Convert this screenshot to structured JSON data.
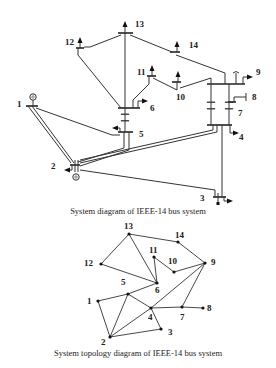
{
  "system_diagram": {
    "caption": "System diagram of IEEE-14 bus system",
    "bus_labels": {
      "1": "1",
      "2": "2",
      "3": "3",
      "4": "4",
      "5": "5",
      "6": "6",
      "7": "7",
      "8": "8",
      "9": "9",
      "10": "10",
      "11": "11",
      "12": "12",
      "13": "13",
      "14": "14"
    }
  },
  "topology_diagram": {
    "caption": "System topology diagram of IEEE-14 bus system",
    "nodes": [
      {
        "id": "1",
        "label": "1"
      },
      {
        "id": "2",
        "label": "2"
      },
      {
        "id": "3",
        "label": "3"
      },
      {
        "id": "4",
        "label": "4"
      },
      {
        "id": "5",
        "label": "5"
      },
      {
        "id": "6",
        "label": "6"
      },
      {
        "id": "7",
        "label": "7"
      },
      {
        "id": "8",
        "label": "8"
      },
      {
        "id": "9",
        "label": "9"
      },
      {
        "id": "10",
        "label": "10"
      },
      {
        "id": "11",
        "label": "11"
      },
      {
        "id": "12",
        "label": "12"
      },
      {
        "id": "13",
        "label": "13"
      },
      {
        "id": "14",
        "label": "14"
      }
    ],
    "edges": [
      [
        "1",
        "2"
      ],
      [
        "1",
        "5"
      ],
      [
        "2",
        "3"
      ],
      [
        "2",
        "4"
      ],
      [
        "2",
        "5"
      ],
      [
        "3",
        "4"
      ],
      [
        "4",
        "5"
      ],
      [
        "4",
        "7"
      ],
      [
        "4",
        "9"
      ],
      [
        "5",
        "6"
      ],
      [
        "6",
        "11"
      ],
      [
        "6",
        "12"
      ],
      [
        "6",
        "13"
      ],
      [
        "7",
        "8"
      ],
      [
        "7",
        "9"
      ],
      [
        "9",
        "10"
      ],
      [
        "9",
        "14"
      ],
      [
        "10",
        "11"
      ],
      [
        "12",
        "13"
      ],
      [
        "13",
        "14"
      ]
    ]
  }
}
